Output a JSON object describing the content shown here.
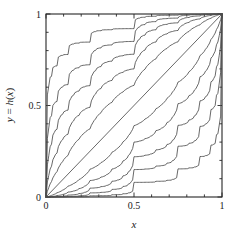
{
  "figure": {
    "kind": "line-plot",
    "background_color": "#ffffff",
    "frame_color": "#262626",
    "curve_color": "#4d4d4d",
    "text_color": "#1a1a1a"
  },
  "axes": {
    "frame": {
      "left": 46,
      "top": 14,
      "right": 222,
      "bottom": 197
    },
    "x": {
      "title": "x",
      "title_parts": [
        "x"
      ],
      "min": 0,
      "max": 1,
      "major_ticks": [
        0,
        0.5,
        1
      ],
      "major_tick_labels": [
        "0",
        "0.5",
        "1"
      ],
      "minor_ticks": [
        0.1,
        0.2,
        0.3,
        0.4,
        0.6,
        0.7,
        0.8,
        0.9
      ],
      "tick_direction": "in"
    },
    "y": {
      "title": "y = h(x)",
      "title_parts": [
        "y",
        " = ",
        "h",
        "(",
        "x",
        ")"
      ],
      "min": 0,
      "max": 1,
      "major_ticks": [
        0,
        0.5,
        1
      ],
      "major_tick_labels": [
        "0",
        "0.5",
        "1"
      ],
      "minor_ticks": [
        0.1,
        0.2,
        0.3,
        0.4,
        0.6,
        0.7,
        0.8,
        0.9
      ],
      "tick_direction": "in",
      "rotation_degrees": -90
    }
  },
  "chart_data": {
    "type": "line",
    "title": "",
    "subtitle": "",
    "xlabel": "x",
    "ylabel": "y = h(x)",
    "xlim": [
      0,
      1
    ],
    "ylim": [
      0,
      1
    ],
    "grid": false,
    "legend": false,
    "legend_position": "none",
    "parameter_name": "p",
    "cascade_levels": 7,
    "series": [
      {
        "name": "p = 0.92",
        "p": 0.92,
        "position": "uppermost-staircase"
      },
      {
        "name": "p = 0.85",
        "p": 0.85,
        "position": "upper-staircase"
      },
      {
        "name": "p = 0.78",
        "p": 0.78,
        "position": "upper-staircase"
      },
      {
        "name": "p = 0.70",
        "p": 0.7,
        "position": "upper-smooth"
      },
      {
        "name": "p = 0.61",
        "p": 0.61,
        "position": "upper-smooth"
      },
      {
        "name": "p = 0.50",
        "p": 0.5,
        "position": "diagonal"
      },
      {
        "name": "p = 0.39",
        "p": 0.39,
        "position": "lower-smooth"
      },
      {
        "name": "p = 0.30",
        "p": 0.3,
        "position": "lower-smooth"
      },
      {
        "name": "p = 0.22",
        "p": 0.22,
        "position": "lower-staircase"
      },
      {
        "name": "p = 0.15",
        "p": 0.15,
        "position": "lower-staircase"
      },
      {
        "name": "p = 0.08",
        "p": 0.08,
        "position": "lowermost-staircase"
      }
    ],
    "anchor_points": [
      {
        "x": 0,
        "y": 0
      },
      {
        "x": 1,
        "y": 1
      }
    ],
    "notable_features": [
      "Uppermost curve has a long plateau at y = 0.5 spanning roughly x = 0.01 to x = 0.11",
      "Lowermost curve has a long plateau at y = 0.5 spanning roughly x = 0.89 to x = 0.99",
      "All curves are monotone non-decreasing from (0,0) to (1,1)"
    ]
  }
}
